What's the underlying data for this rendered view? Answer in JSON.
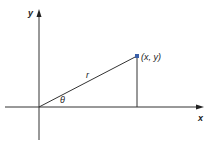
{
  "diagram": {
    "axes": {
      "x_label": "x",
      "y_label": "y"
    },
    "point_label": "(x, y)",
    "radius_label": "r",
    "angle_label": "θ",
    "colors": {
      "line": "#333333",
      "point": "#3a5fa8"
    }
  }
}
